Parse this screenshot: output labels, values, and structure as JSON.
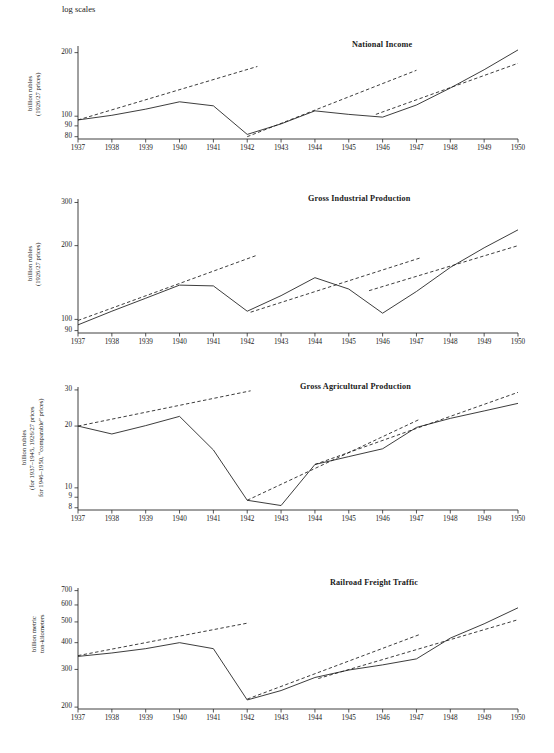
{
  "figure": {
    "log_scales_note": "log scales",
    "x_tick_labels": [
      "1937",
      "1938",
      "1939",
      "1940",
      "1941",
      "1942",
      "1943",
      "1944",
      "1945",
      "1946",
      "1947",
      "1948",
      "1949",
      "1950"
    ]
  },
  "chart_data": [
    {
      "type": "line",
      "title": "National Income",
      "ylabel": "billion rubles\n(1926/27 prices)",
      "xlabel": "",
      "scale": "log",
      "grid": false,
      "legend": "none",
      "ylim": [
        78,
        215
      ],
      "ytick_labels": [
        "200",
        "100",
        "90",
        "80"
      ],
      "yticks": [
        200,
        100,
        90,
        80
      ],
      "x": [
        1937,
        1938,
        1939,
        1940,
        1941,
        1942,
        1943,
        1944,
        1945,
        1946,
        1947,
        1948,
        1949,
        1950
      ],
      "series": [
        {
          "name": "actual",
          "style": "solid",
          "values": [
            96,
            101,
            108,
            117,
            112,
            82,
            92,
            106,
            102,
            99,
            113,
            136,
            166,
            206
          ]
        },
        {
          "name": "prewar-trend",
          "style": "dashed",
          "x": [
            1937,
            1942.3
          ],
          "values": [
            96,
            172
          ]
        },
        {
          "name": "wartime-recovery-trend",
          "style": "dashed",
          "x": [
            1942,
            1947
          ],
          "values": [
            80,
            165
          ]
        },
        {
          "name": "postwar-trend",
          "style": "dashed",
          "x": [
            1945.8,
            1950
          ],
          "values": [
            102,
            178
          ]
        }
      ]
    },
    {
      "type": "line",
      "title": "Gross Industrial Production",
      "ylabel": "billion rubles\n(1926/27 prices)",
      "xlabel": "",
      "scale": "log",
      "grid": false,
      "legend": "none",
      "ylim": [
        88,
        310
      ],
      "ytick_labels": [
        "300",
        "200",
        "100",
        "90"
      ],
      "yticks": [
        300,
        200,
        100,
        90
      ],
      "x": [
        1937,
        1938,
        1939,
        1940,
        1941,
        1942,
        1943,
        1944,
        1945,
        1946,
        1947,
        1948,
        1949,
        1950
      ],
      "series": [
        {
          "name": "actual",
          "style": "solid",
          "values": [
            95,
            108,
            122,
            138,
            137,
            108,
            125,
            148,
            133,
            106,
            130,
            163,
            196,
            232
          ]
        },
        {
          "name": "prewar-trend",
          "style": "dashed",
          "x": [
            1937,
            1942.3
          ],
          "values": [
            99,
            183
          ]
        },
        {
          "name": "wartime-recovery-trend",
          "style": "dashed",
          "x": [
            1942.1,
            1947.1
          ],
          "values": [
            107,
            178
          ]
        },
        {
          "name": "postwar-trend",
          "style": "dashed",
          "x": [
            1945.6,
            1950
          ],
          "values": [
            131,
            200
          ]
        }
      ]
    },
    {
      "type": "line",
      "title": "Gross Agricultural Production",
      "ylabel": "billion rubles\n(for 1937–1945, 1926/27 prices\nfor 1946–1950, “comparable” prices)",
      "xlabel": "",
      "scale": "log",
      "grid": false,
      "legend": "none",
      "ylim": [
        7.8,
        31
      ],
      "ytick_labels": [
        "30",
        "20",
        "10",
        "9",
        "8"
      ],
      "yticks": [
        30,
        20,
        10,
        9,
        8
      ],
      "x": [
        1937,
        1938,
        1939,
        1940,
        1941,
        1942,
        1943,
        1944,
        1945,
        1946,
        1947,
        1948,
        1949,
        1950
      ],
      "series": [
        {
          "name": "actual",
          "style": "solid",
          "values": [
            20.0,
            18.3,
            20.1,
            22.3,
            15.3,
            8.7,
            8.2,
            13.0,
            14.2,
            15.5,
            19.7,
            21.8,
            23.7,
            25.8
          ]
        },
        {
          "name": "prewar-trend",
          "style": "dashed",
          "x": [
            1937,
            1942.1
          ],
          "values": [
            20.0,
            29.7
          ]
        },
        {
          "name": "wartime-recovery-trend",
          "style": "dashed",
          "x": [
            1942,
            1947.1
          ],
          "values": [
            8.7,
            21.6
          ]
        },
        {
          "name": "postwar-trend",
          "style": "dashed",
          "x": [
            1944,
            1950
          ],
          "values": [
            13.0,
            29.2
          ]
        }
      ]
    },
    {
      "type": "line",
      "title": "Railroad Freight Traffic",
      "ylabel": "billion metric\nton-kilometers",
      "xlabel": "",
      "scale": "log",
      "grid": false,
      "legend": "none",
      "ylim": [
        196,
        720
      ],
      "ytick_labels": [
        "700",
        "600",
        "500",
        "400",
        "300",
        "200"
      ],
      "yticks": [
        700,
        600,
        500,
        400,
        300,
        200
      ],
      "x": [
        1937,
        1938,
        1939,
        1940,
        1941,
        1942,
        1943,
        1944,
        1945,
        1946,
        1947,
        1948,
        1949,
        1950
      ],
      "series": [
        {
          "name": "actual",
          "style": "solid",
          "values": [
            345,
            358,
            375,
            400,
            375,
            216,
            239,
            275,
            298,
            315,
            336,
            420,
            490,
            582
          ]
        },
        {
          "name": "prewar-trend",
          "style": "dashed",
          "x": [
            1937,
            1942.05
          ],
          "values": [
            348,
            495
          ]
        },
        {
          "name": "wartime-recovery-trend",
          "style": "dashed",
          "x": [
            1942,
            1947.1
          ],
          "values": [
            218,
            437
          ]
        },
        {
          "name": "postwar-trend",
          "style": "dashed",
          "x": [
            1944.1,
            1950
          ],
          "values": [
            272,
            512
          ]
        }
      ]
    }
  ]
}
